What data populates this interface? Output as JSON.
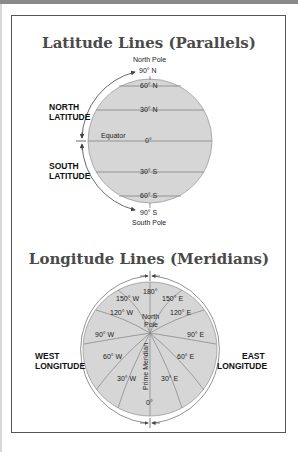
{
  "latitude": {
    "title": "Latitude Lines (Parallels)",
    "north_pole": "North Pole",
    "south_pole": "South Pole",
    "north_label": "NORTH\nLATITUDE",
    "north_label_1": "NORTH",
    "north_label_2": "LATITUDE",
    "south_label_1": "SOUTH",
    "south_label_2": "LATITUDE",
    "equator": "Equator",
    "lines": [
      {
        "label": "90° N"
      },
      {
        "label": "60° N"
      },
      {
        "label": "30° N"
      },
      {
        "label": "0°"
      },
      {
        "label": "30° S"
      },
      {
        "label": "60° S"
      },
      {
        "label": "90° S"
      }
    ]
  },
  "longitude": {
    "title": "Longitude Lines (Meridians)",
    "north_pole_1": "North",
    "north_pole_2": "Pole",
    "prime_meridian": "Prime Meridian",
    "west_label_1": "WEST",
    "west_label_2": "LONGITUDE",
    "east_label_1": "EAST",
    "east_label_2": "LONGITUDE",
    "meridians": {
      "m180": "180°",
      "w150": "150° W",
      "e150": "150° E",
      "w120": "120° W",
      "e120": "120° E",
      "w90": "90° W",
      "e90": "90° E",
      "w60": "60° W",
      "e60": "60° E",
      "w30": "30° W",
      "e30": "30° E",
      "zero": "0°"
    }
  },
  "colors": {
    "globe_fill": "#d6d6d6",
    "globe_line": "#8c8c8c",
    "title": "#4a4a4a",
    "frame": "#555555"
  }
}
